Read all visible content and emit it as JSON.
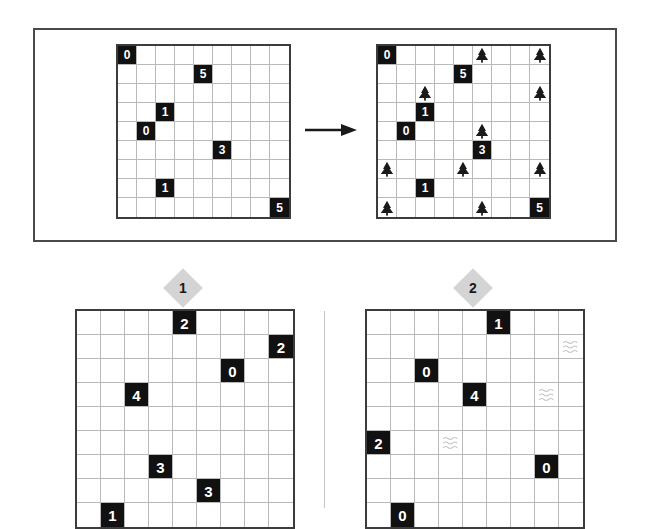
{
  "page": {
    "grid_size": 9,
    "colors": {
      "clue_cell_bg": "#111111",
      "clue_text": "#ffffff",
      "grid_line": "#b9b9b9",
      "grid_border": "#3c3c3c",
      "frame_border": "#4a4a4a",
      "badge_fill": "#d4d4d4",
      "badge_text": "#1a1a1a",
      "tree_fill": "#1a1a1a",
      "water_stroke": "#c8c8c8",
      "divider": "#c4c4c4",
      "page_bg": "#ffffff"
    }
  },
  "example": {
    "arrow_icon": "arrow-right-icon",
    "puzzle": {
      "name": "example-puzzle-grid",
      "rows": 9,
      "cols": 9,
      "clues": [
        {
          "row": 1,
          "col": 1,
          "value": "0"
        },
        {
          "row": 2,
          "col": 5,
          "value": "5"
        },
        {
          "row": 4,
          "col": 3,
          "value": "1"
        },
        {
          "row": 5,
          "col": 2,
          "value": "0"
        },
        {
          "row": 6,
          "col": 6,
          "value": "3"
        },
        {
          "row": 8,
          "col": 3,
          "value": "1"
        },
        {
          "row": 9,
          "col": 9,
          "value": "5"
        }
      ],
      "trees": [],
      "water": []
    },
    "solution": {
      "name": "example-solution-grid",
      "rows": 9,
      "cols": 9,
      "clues": [
        {
          "row": 1,
          "col": 1,
          "value": "0"
        },
        {
          "row": 2,
          "col": 5,
          "value": "5"
        },
        {
          "row": 4,
          "col": 3,
          "value": "1"
        },
        {
          "row": 5,
          "col": 2,
          "value": "0"
        },
        {
          "row": 6,
          "col": 6,
          "value": "3"
        },
        {
          "row": 8,
          "col": 3,
          "value": "1"
        },
        {
          "row": 9,
          "col": 9,
          "value": "5"
        }
      ],
      "trees": [
        {
          "row": 0,
          "col": 5
        },
        {
          "row": 0,
          "col": 8
        },
        {
          "row": 2,
          "col": 2
        },
        {
          "row": 2,
          "col": 8
        },
        {
          "row": 4,
          "col": 5
        },
        {
          "row": 6,
          "col": 0
        },
        {
          "row": 6,
          "col": 4
        },
        {
          "row": 6,
          "col": 8
        },
        {
          "row": 8,
          "col": 0
        },
        {
          "row": 8,
          "col": 5
        }
      ],
      "water": []
    }
  },
  "puzzles": [
    {
      "badge": "1",
      "name": "puzzle-one-grid",
      "rows": 9,
      "cols": 9,
      "clues": [
        {
          "row": 1,
          "col": 5,
          "value": "2"
        },
        {
          "row": 2,
          "col": 9,
          "value": "2"
        },
        {
          "row": 3,
          "col": 7,
          "value": "0"
        },
        {
          "row": 4,
          "col": 3,
          "value": "4"
        },
        {
          "row": 7,
          "col": 4,
          "value": "3"
        },
        {
          "row": 8,
          "col": 6,
          "value": "3"
        },
        {
          "row": 9,
          "col": 2,
          "value": "1"
        }
      ],
      "trees": [],
      "water": []
    },
    {
      "badge": "2",
      "name": "puzzle-two-grid",
      "rows": 9,
      "cols": 9,
      "clues": [
        {
          "row": 1,
          "col": 6,
          "value": "1"
        },
        {
          "row": 3,
          "col": 3,
          "value": "0"
        },
        {
          "row": 4,
          "col": 5,
          "value": "4"
        },
        {
          "row": 6,
          "col": 1,
          "value": "2"
        },
        {
          "row": 7,
          "col": 8,
          "value": "0"
        },
        {
          "row": 9,
          "col": 2,
          "value": "0"
        }
      ],
      "trees": [],
      "water": [
        {
          "row": 2,
          "col": 9
        },
        {
          "row": 4,
          "col": 8
        },
        {
          "row": 6,
          "col": 4
        }
      ]
    }
  ]
}
